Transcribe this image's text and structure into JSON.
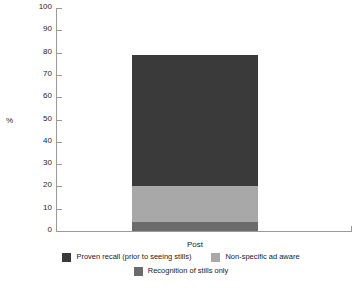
{
  "chart_data": {
    "type": "bar",
    "subtype": "stacked-bar",
    "title": "",
    "subtitle": "",
    "xlabel": "",
    "ylabel": "%",
    "categories": [
      "Post"
    ],
    "ylim": [
      0,
      100
    ],
    "yticks": [
      0,
      10,
      20,
      30,
      40,
      50,
      60,
      70,
      80,
      90,
      100
    ],
    "ytick_labels": [
      "0",
      "10",
      "20",
      "30",
      "40",
      "50",
      "60",
      "70",
      "80",
      "90",
      "100"
    ],
    "grid": false,
    "legend_position": "bottom",
    "stack_order_bottom_to_top": [
      "Recognition of stills only",
      "Non-specific ad aware",
      "Proven recall (prior to seeing stills)"
    ],
    "total": 79,
    "series": [
      {
        "name": "Proven recall (prior to seeing stills)",
        "color": "#3a3a3a",
        "values": [
          59
        ],
        "segment_range": [
          20,
          79
        ]
      },
      {
        "name": "Non-specific ad aware",
        "color": "#a8a8a8",
        "values": [
          16
        ],
        "segment_range": [
          4,
          20
        ]
      },
      {
        "name": "Recognition of stills only",
        "color": "#6b6b6b",
        "values": [
          4
        ],
        "segment_range": [
          0,
          4
        ]
      }
    ]
  },
  "legend": {
    "row1": [
      {
        "label": "Proven recall (prior to seeing stills)",
        "color": "#3a3a3a"
      },
      {
        "label": "Non-specific ad  aware",
        "color": "#a8a8a8"
      }
    ],
    "row2": [
      {
        "label": "Recognition of stills only",
        "color": "#6b6b6b"
      }
    ]
  },
  "axis": {
    "y_title": "%",
    "x_category_0": "Post"
  },
  "colors": {
    "axis_line": "#9a9a9a",
    "text": "#1a1a1a",
    "background": "#ffffff"
  }
}
